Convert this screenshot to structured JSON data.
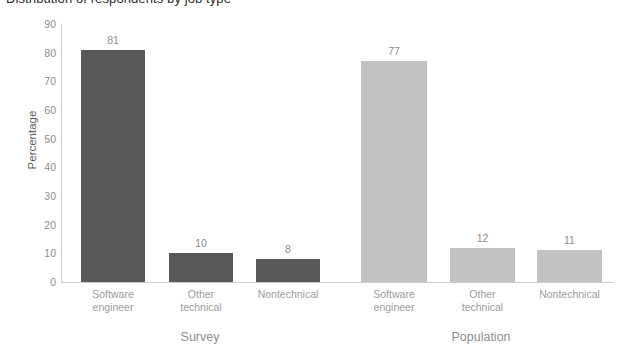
{
  "chart_data": {
    "type": "bar",
    "title": "Distribution of respondents by job type",
    "xlabel": "",
    "ylabel": "Percentage",
    "ylim": [
      0,
      90
    ],
    "yticks": [
      0,
      10,
      20,
      30,
      40,
      50,
      60,
      70,
      80,
      90
    ],
    "grid": false,
    "legend": "none",
    "categories": [
      "Software\nengineer",
      "Other\ntechnical",
      "Nontechnical"
    ],
    "groups": [
      "Survey",
      "Population"
    ],
    "series": [
      {
        "name": "Survey",
        "color": "#595959",
        "values": [
          81,
          10,
          8
        ]
      },
      {
        "name": "Population",
        "color": "#c2c2c2",
        "values": [
          77,
          12,
          11
        ]
      }
    ],
    "bars": [
      {
        "group": "Survey",
        "category": "Software\nengineer",
        "value": 81,
        "label": "81",
        "color": "#595959",
        "x": 81,
        "width": 64
      },
      {
        "group": "Survey",
        "category": "Other\ntechnical",
        "value": 10,
        "label": "10",
        "color": "#595959",
        "x": 169,
        "width": 64
      },
      {
        "group": "Survey",
        "category": "Nontechnical",
        "value": 8,
        "label": "8",
        "color": "#595959",
        "x": 256,
        "width": 64
      },
      {
        "group": "Population",
        "category": "Software\nengineer",
        "value": 77,
        "label": "77",
        "color": "#c2c2c2",
        "x": 361,
        "width": 66
      },
      {
        "group": "Population",
        "category": "Other\ntechnical",
        "value": 12,
        "label": "12",
        "color": "#c2c2c2",
        "x": 450,
        "width": 65
      },
      {
        "group": "Population",
        "category": "Nontechnical",
        "value": 11,
        "label": "11",
        "color": "#c2c2c2",
        "x": 537,
        "width": 65
      }
    ],
    "group_positions": [
      {
        "label": "Survey",
        "center": 200
      },
      {
        "label": "Population",
        "center": 481
      }
    ],
    "axis": {
      "baseline_y": 282,
      "top_y": 24,
      "pixels_per_unit": 2.8667
    },
    "colors": {
      "survey_bar": "#595959",
      "population_bar": "#c2c2c2",
      "axis": "#cccccc",
      "tick_text": "#8e8e8e",
      "category_text": "#9c9c9c",
      "axis_title": "#5e5e5e",
      "background": "#ffffff"
    }
  }
}
